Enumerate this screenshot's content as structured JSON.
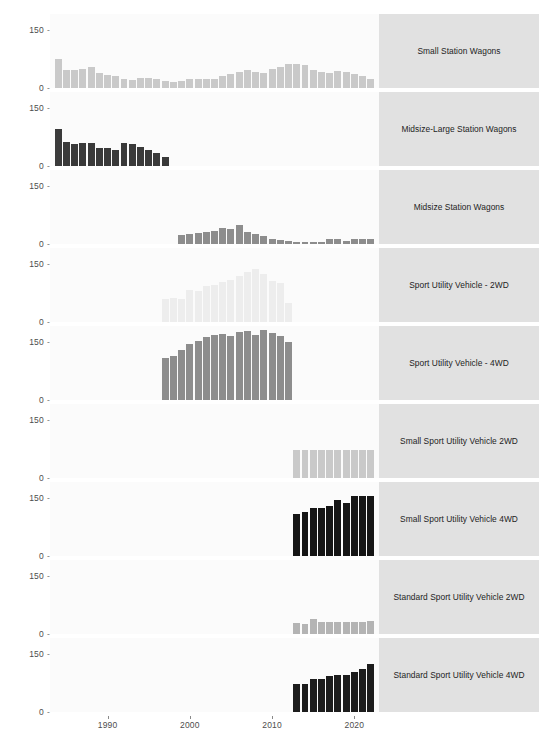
{
  "chart_data": {
    "type": "bar",
    "title": "",
    "subtitle": "",
    "xlabel": "",
    "ylabel": "",
    "xlim": [
      1983,
      2023
    ],
    "ylim": [
      0,
      190
    ],
    "ytick_values": [
      0,
      150
    ],
    "ytick_labels": [
      "0",
      "150"
    ],
    "xtick_values": [
      1990,
      2000,
      2010,
      2020
    ],
    "xtick_labels": [
      "1990",
      "2000",
      "2010",
      "2020"
    ],
    "grid": false,
    "legend": "none",
    "facet_layout": "9 rows x 1 column, strip labels on right",
    "colors": {
      "panel_background": "#fbfbfb",
      "strip_background": "#e1e1e1",
      "axis_text": "#4d4d4d",
      "strip_text": "#1d1d1d"
    },
    "panels": [
      {
        "label": "Small Station Wagons",
        "bar_color": "#c9c9c9",
        "x": [
          1984,
          1985,
          1986,
          1987,
          1988,
          1989,
          1990,
          1991,
          1992,
          1993,
          1994,
          1995,
          1996,
          1997,
          1998,
          1999,
          2000,
          2001,
          2002,
          2003,
          2004,
          2005,
          2006,
          2007,
          2008,
          2009,
          2010,
          2011,
          2012,
          2013,
          2014,
          2015,
          2016,
          2017,
          2018,
          2019,
          2020,
          2021,
          2022
        ],
        "values": [
          74,
          47,
          46,
          50,
          53,
          38,
          34,
          32,
          23,
          20,
          25,
          25,
          24,
          19,
          16,
          19,
          22,
          24,
          22,
          23,
          32,
          36,
          40,
          47,
          41,
          38,
          48,
          53,
          61,
          61,
          58,
          45,
          40,
          38,
          44,
          42,
          35,
          30,
          22
        ]
      },
      {
        "label": "Midsize-Large Station Wagons",
        "bar_color": "#3a3a3a",
        "x": [
          1984,
          1985,
          1986,
          1987,
          1988,
          1989,
          1990,
          1991,
          1992,
          1993,
          1994,
          1995,
          1996,
          1997
        ],
        "values": [
          95,
          62,
          57,
          58,
          58,
          47,
          45,
          42,
          59,
          57,
          50,
          41,
          34,
          22
        ]
      },
      {
        "label": "Midsize Station Wagons",
        "bar_color": "#8d8d8d",
        "x": [
          1999,
          2000,
          2001,
          2002,
          2003,
          2004,
          2005,
          2006,
          2007,
          2008,
          2009,
          2010,
          2011,
          2012,
          2013,
          2014,
          2015,
          2016,
          2017,
          2018,
          2019,
          2020,
          2021,
          2022
        ],
        "values": [
          22,
          25,
          29,
          31,
          34,
          42,
          38,
          50,
          31,
          25,
          20,
          12,
          10,
          8,
          6,
          5,
          4,
          6,
          14,
          14,
          9,
          13,
          14,
          13
        ]
      },
      {
        "label": "Sport Utility Vehicle - 2WD",
        "bar_color": "#ededed",
        "x": [
          1997,
          1998,
          1999,
          2000,
          2001,
          2002,
          2003,
          2004,
          2005,
          2006,
          2007,
          2008,
          2009,
          2010,
          2011,
          2012
        ],
        "values": [
          60,
          62,
          60,
          82,
          79,
          92,
          95,
          103,
          108,
          118,
          129,
          136,
          122,
          106,
          99,
          50
        ]
      },
      {
        "label": "Sport Utility Vehicle - 4WD",
        "bar_color": "#8d8d8d",
        "x": [
          1997,
          1998,
          1999,
          2000,
          2001,
          2002,
          2003,
          2004,
          2005,
          2006,
          2007,
          2008,
          2009,
          2010,
          2011,
          2012
        ],
        "values": [
          109,
          113,
          129,
          145,
          152,
          162,
          166,
          169,
          165,
          175,
          178,
          166,
          180,
          171,
          165,
          149
        ]
      },
      {
        "label": "Small Sport Utility Vehicle 2WD",
        "bar_color": "#c9c9c9",
        "x": [
          2013,
          2014,
          2015,
          2016,
          2017,
          2018,
          2019,
          2020,
          2021,
          2022
        ],
        "values": [
          72,
          72,
          73,
          73,
          73,
          72,
          71,
          71,
          71,
          71
        ]
      },
      {
        "label": "Small Sport Utility Vehicle 4WD",
        "bar_color": "#161616",
        "x": [
          2013,
          2014,
          2015,
          2016,
          2017,
          2018,
          2019,
          2020,
          2021,
          2022
        ],
        "values": [
          107,
          112,
          122,
          123,
          128,
          143,
          137,
          153,
          155,
          155
        ]
      },
      {
        "label": "Standard Sport Utility Vehicle 2WD",
        "bar_color": "#b4b4b4",
        "x": [
          2013,
          2014,
          2015,
          2016,
          2017,
          2018,
          2019,
          2020,
          2021,
          2022
        ],
        "values": [
          27,
          26,
          38,
          30,
          31,
          31,
          31,
          30,
          30,
          34
        ]
      },
      {
        "label": "Standard Sport Utility Vehicle 4WD",
        "bar_color": "#1d1d1d",
        "x": [
          2013,
          2014,
          2015,
          2016,
          2017,
          2018,
          2019,
          2020,
          2021,
          2022
        ],
        "values": [
          72,
          72,
          85,
          86,
          92,
          94,
          95,
          104,
          111,
          122
        ]
      }
    ]
  }
}
